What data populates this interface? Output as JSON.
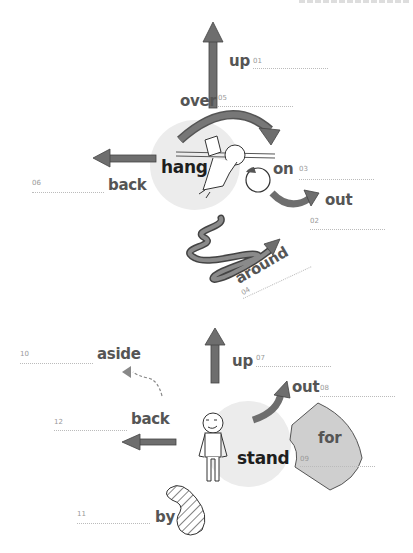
{
  "header": {
    "text": ""
  },
  "section1": {
    "center": "hang",
    "items": [
      {
        "num": "01",
        "word": "up"
      },
      {
        "num": "02",
        "word": "out"
      },
      {
        "num": "03",
        "word": "on"
      },
      {
        "num": "04",
        "word": "around"
      },
      {
        "num": "05",
        "word": "over"
      },
      {
        "num": "06",
        "word": "back"
      }
    ]
  },
  "section2": {
    "center": "stand",
    "items": [
      {
        "num": "07",
        "word": "up"
      },
      {
        "num": "08",
        "word": "out"
      },
      {
        "num": "09",
        "word": "for"
      },
      {
        "num": "10",
        "word": "aside"
      },
      {
        "num": "11",
        "word": "by"
      },
      {
        "num": "12",
        "word": "back"
      }
    ]
  },
  "colors": {
    "arrow": "#6e6e6e",
    "disc": "#ececec",
    "for_shape": "#cfcfcf",
    "line": "#bbbbbb"
  }
}
